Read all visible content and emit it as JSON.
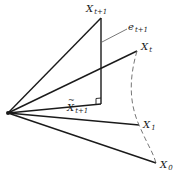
{
  "diagram": {
    "colors": {
      "line": "#1a1a1a",
      "leader": "#555555",
      "dashed": "#666666",
      "background": "#ffffff"
    },
    "origin": {
      "x": 8,
      "y": 113
    },
    "points": {
      "x_t_plus_1": {
        "x": 101,
        "y": 18
      },
      "foot": {
        "x": 101,
        "y": 104
      },
      "x_t": {
        "x": 137,
        "y": 51
      },
      "x_1": {
        "x": 139,
        "y": 125
      },
      "x_0": {
        "x": 156,
        "y": 163
      }
    },
    "labels": {
      "x_t_plus_1": {
        "base": "X",
        "sub": "t+1"
      },
      "e_t_plus_1": {
        "base": "e",
        "sub": "t+1"
      },
      "x_t": {
        "base": "X",
        "sub": "t"
      },
      "x_tilde_t_plus_1": {
        "base": "X",
        "sub": "t+1",
        "accent": "tilde"
      },
      "x_1": {
        "base": "X",
        "sub": "1"
      },
      "x_0": {
        "base": "X",
        "sub": "0"
      }
    }
  }
}
